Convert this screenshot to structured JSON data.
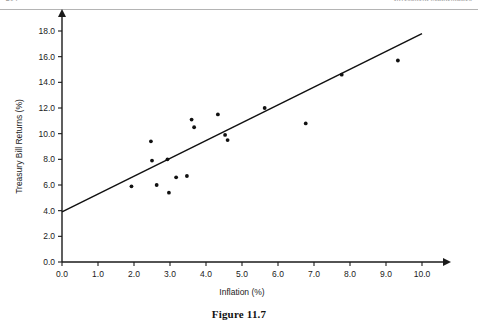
{
  "header": {
    "left_folio": "214",
    "right_running_head": "Investment Mathematics"
  },
  "caption": "Figure 11.7",
  "chart_data": {
    "type": "scatter",
    "title": "",
    "xlabel": "Inflation (%)",
    "ylabel": "Treasury Bill Returns (%)",
    "xlim": [
      0.0,
      10.0
    ],
    "ylim": [
      0.0,
      18.0
    ],
    "xticks": [
      "0.0",
      "1.0",
      "2.0",
      "3.0",
      "4.0",
      "5.0",
      "6.0",
      "7.0",
      "8.0",
      "9.0",
      "10.0"
    ],
    "yticks": [
      "0.0",
      "2.0",
      "4.0",
      "6.0",
      "8.0",
      "10.0",
      "12.0",
      "14.0",
      "16.0",
      "18.0"
    ],
    "grid": false,
    "legend": false,
    "points": [
      {
        "x": 1.93,
        "y": 5.9
      },
      {
        "x": 2.47,
        "y": 9.4
      },
      {
        "x": 2.5,
        "y": 7.9
      },
      {
        "x": 2.63,
        "y": 6.0
      },
      {
        "x": 2.93,
        "y": 8.0
      },
      {
        "x": 2.97,
        "y": 5.4
      },
      {
        "x": 3.17,
        "y": 6.6
      },
      {
        "x": 3.47,
        "y": 6.7
      },
      {
        "x": 3.6,
        "y": 11.1
      },
      {
        "x": 3.67,
        "y": 10.5
      },
      {
        "x": 4.33,
        "y": 11.5
      },
      {
        "x": 4.53,
        "y": 9.9
      },
      {
        "x": 4.6,
        "y": 9.5
      },
      {
        "x": 5.63,
        "y": 12.0
      },
      {
        "x": 6.77,
        "y": 10.8
      },
      {
        "x": 7.77,
        "y": 14.6
      },
      {
        "x": 9.33,
        "y": 15.7
      }
    ],
    "trendline": {
      "x0": 0.0,
      "y0": 3.9,
      "x1": 10.0,
      "y1": 17.8
    },
    "colors": {
      "axis": "#1a1a1a",
      "point": "#111111",
      "trendline": "#111111"
    }
  }
}
